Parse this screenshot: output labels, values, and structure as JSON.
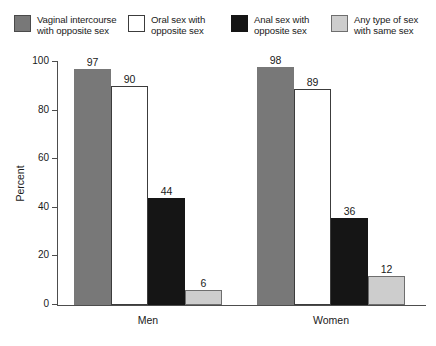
{
  "legend": {
    "items": [
      {
        "label": "Vaginal intercourse\nwith opposite sex",
        "color": "#787878",
        "border": "#4a4a4a"
      },
      {
        "label": "Oral sex with\nopposite sex",
        "color": "#ffffff",
        "border": "#3c3c3c"
      },
      {
        "label": "Anal sex with\nopposite sex",
        "color": "#151515",
        "border": "#151515"
      },
      {
        "label": "Any type of sex\nwith same sex",
        "color": "#cdcdcd",
        "border": "#6e6e6e"
      }
    ]
  },
  "axis": {
    "ylabel": "Percent",
    "yticks": [
      "0",
      "20",
      "40",
      "60",
      "80",
      "100"
    ]
  },
  "chart_data": {
    "type": "bar",
    "title": "",
    "xlabel": "",
    "ylabel": "Percent",
    "ylim": [
      0,
      100
    ],
    "ytick_step": 20,
    "grid": false,
    "legend_position": "top",
    "categories": [
      "Men",
      "Women"
    ],
    "series": [
      {
        "name": "Vaginal intercourse with opposite sex",
        "color": "#787878",
        "values": [
          97,
          98
        ]
      },
      {
        "name": "Oral sex with opposite sex",
        "color": "#ffffff",
        "values": [
          90,
          89
        ]
      },
      {
        "name": "Anal sex with opposite sex",
        "color": "#151515",
        "values": [
          44,
          36
        ]
      },
      {
        "name": "Any type of sex with same sex",
        "color": "#cdcdcd",
        "values": [
          6,
          12
        ]
      }
    ]
  }
}
